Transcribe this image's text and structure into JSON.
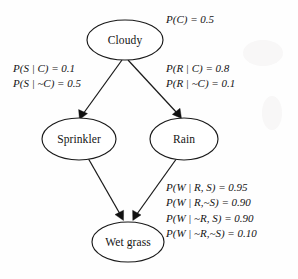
{
  "diagram": {
    "type": "bayesian-network",
    "nodes": [
      {
        "id": "cloudy",
        "label": "Cloudy",
        "cx": 125,
        "cy": 40,
        "rx": 38,
        "ry": 20
      },
      {
        "id": "sprinkler",
        "label": "Sprinkler",
        "cx": 79,
        "cy": 139,
        "rx": 37,
        "ry": 21
      },
      {
        "id": "rain",
        "label": "Rain",
        "cx": 184,
        "cy": 139,
        "rx": 34,
        "ry": 21
      },
      {
        "id": "wetgrass",
        "label": "Wet grass",
        "cx": 128,
        "cy": 242,
        "rx": 36,
        "ry": 20
      }
    ],
    "edges": [
      {
        "id": "cloudy-sprinkler",
        "from": "cloudy",
        "to": "sprinkler"
      },
      {
        "id": "cloudy-rain",
        "from": "cloudy",
        "to": "rain"
      },
      {
        "id": "sprinkler-wetgrass",
        "from": "sprinkler",
        "to": "wetgrass"
      },
      {
        "id": "rain-wetgrass",
        "from": "rain",
        "to": "wetgrass"
      }
    ],
    "stroke_color": "#1a1a1a",
    "background_color": "#fefefe",
    "text_color": "#141414"
  },
  "cpt": {
    "cloudy": {
      "lines": [
        "P(C) = 0.5"
      ]
    },
    "sprinkler": {
      "lines": [
        "P(S | C) = 0.1",
        "P(S | ~C) = 0.5"
      ]
    },
    "rain": {
      "lines": [
        "P(R | C) = 0.8",
        "P(R | ~C) = 0.1"
      ]
    },
    "wetgrass": {
      "lines": [
        "P(W | R, S) = 0.95",
        "P(W | R,~S) = 0.90",
        "P(W | ~R, S) = 0.90",
        "P(W | ~R,~S) = 0.10"
      ]
    }
  }
}
